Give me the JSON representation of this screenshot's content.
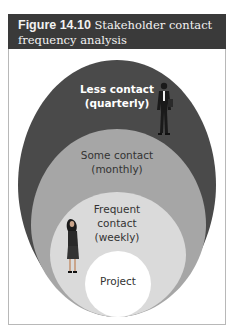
{
  "figure": {
    "number": "Figure 14.10",
    "title_line1": "Stakeholder contact",
    "title_line2": "frequency analysis"
  },
  "diagram": {
    "rings": [
      {
        "label_line1": "Less contact",
        "label_line2": "(quarterly)",
        "color": "#4a4a4a",
        "text_color": "#ffffff"
      },
      {
        "label_line1": "Some contact",
        "label_line2": "(monthly)",
        "color": "#a6a6a6",
        "text_color": "#333333"
      },
      {
        "label_line1": "Frequent",
        "label_line2": "contact",
        "label_line3": "(weekly)",
        "color": "#d9d9d9",
        "text_color": "#333333"
      },
      {
        "label_line1": "Project",
        "color": "#ffffff",
        "text_color": "#333333"
      }
    ],
    "figures": [
      "businessman-illustration",
      "businesswoman-illustration"
    ]
  }
}
